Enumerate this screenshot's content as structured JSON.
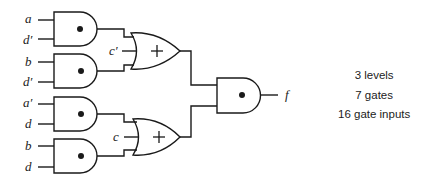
{
  "diagram": {
    "type": "logic-circuit",
    "inputs": [
      {
        "label": "a",
        "gate": "and1"
      },
      {
        "label": "d′",
        "gate": "and1"
      },
      {
        "label": "b",
        "gate": "and2"
      },
      {
        "label": "d′",
        "gate": "and2"
      },
      {
        "label": "a′",
        "gate": "and3"
      },
      {
        "label": "d",
        "gate": "and3"
      },
      {
        "label": "b",
        "gate": "and4"
      },
      {
        "label": "d",
        "gate": "and4"
      }
    ],
    "or_inputs": [
      {
        "label": "c′",
        "gate": "or1"
      },
      {
        "label": "c",
        "gate": "or2"
      }
    ],
    "gates": [
      {
        "id": "and1",
        "type": "AND",
        "symbol": "•"
      },
      {
        "id": "and2",
        "type": "AND",
        "symbol": "•"
      },
      {
        "id": "and3",
        "type": "AND",
        "symbol": "•"
      },
      {
        "id": "and4",
        "type": "AND",
        "symbol": "•"
      },
      {
        "id": "or1",
        "type": "OR",
        "symbol": "+"
      },
      {
        "id": "or2",
        "type": "OR",
        "symbol": "+"
      },
      {
        "id": "and5",
        "type": "AND",
        "symbol": "•"
      }
    ],
    "output": {
      "label": "f"
    }
  },
  "stats": {
    "levels": "3 levels",
    "gates": "7 gates",
    "gate_inputs": "16 gate inputs"
  },
  "colors": {
    "stroke": "#1a1a1a",
    "background": "#ffffff"
  }
}
